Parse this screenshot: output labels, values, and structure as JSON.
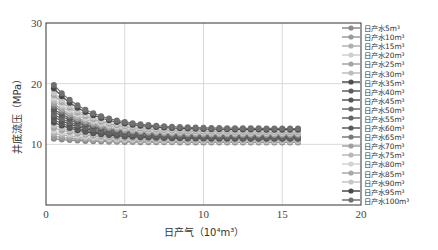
{
  "chart_data": {
    "type": "line",
    "title": "",
    "xlabel": "日产气（10⁴m³）",
    "ylabel": "井底流压（MPa）",
    "xlim": [
      0,
      20
    ],
    "ylim": [
      0,
      30
    ],
    "xticks": [
      "0",
      "5",
      "10",
      "15",
      "20"
    ],
    "yticks": [
      "10",
      "20",
      "30"
    ],
    "grid": true,
    "legend_position": "right",
    "markers": "circle",
    "x": [
      0.5,
      1,
      1.5,
      2,
      2.5,
      3,
      3.5,
      4,
      4.5,
      5,
      5.5,
      6,
      6.5,
      7,
      7.5,
      8,
      8.5,
      9,
      9.5,
      10,
      10.5,
      11,
      11.5,
      12,
      12.5,
      13,
      13.5,
      14,
      14.5,
      15,
      15.5,
      16
    ],
    "series": [
      {
        "name": "日产水5m³",
        "start": 10.9,
        "end": 10.3,
        "color": "#8a8a8a"
      },
      {
        "name": "日产水10m³",
        "start": 11.3,
        "end": 10.4,
        "color": "#9a9a9a"
      },
      {
        "name": "日产水15m³",
        "start": 11.8,
        "end": 10.5,
        "color": "#b0b0b0"
      },
      {
        "name": "日产水20m³",
        "start": 12.2,
        "end": 10.6,
        "color": "#cfcfcf"
      },
      {
        "name": "日产水25m³",
        "start": 12.7,
        "end": 10.7,
        "color": "#a5a5a5"
      },
      {
        "name": "日产水30m³",
        "start": 13.1,
        "end": 10.8,
        "color": "#bdbdbd"
      },
      {
        "name": "日产水35m³",
        "start": 13.6,
        "end": 10.9,
        "color": "#4e4e4e"
      },
      {
        "name": "日产水40m³",
        "start": 14.0,
        "end": 11.0,
        "color": "#5e5e5e"
      },
      {
        "name": "日产水45m³",
        "start": 14.5,
        "end": 11.1,
        "color": "#555555"
      },
      {
        "name": "日产水50m³",
        "start": 14.9,
        "end": 11.2,
        "color": "#6a6a6a"
      },
      {
        "name": "日产水55m³",
        "start": 15.4,
        "end": 11.3,
        "color": "#666666"
      },
      {
        "name": "日产水60m³",
        "start": 15.8,
        "end": 11.4,
        "color": "#5a5a5a"
      },
      {
        "name": "日产水65m³",
        "start": 16.3,
        "end": 11.5,
        "color": "#7a7a7a"
      },
      {
        "name": "日产水70m³",
        "start": 16.7,
        "end": 11.6,
        "color": "#a0a0a0"
      },
      {
        "name": "日产水75m³",
        "start": 17.2,
        "end": 11.8,
        "color": "#b8b8b8"
      },
      {
        "name": "日产水80m³",
        "start": 17.6,
        "end": 11.9,
        "color": "#d2d2d2"
      },
      {
        "name": "日产水85m³",
        "start": 18.1,
        "end": 12.0,
        "color": "#a8a8a8"
      },
      {
        "name": "日产水90m³",
        "start": 18.5,
        "end": 12.2,
        "color": "#c6c6c6"
      },
      {
        "name": "日产水95m³",
        "start": 19.2,
        "end": 12.4,
        "color": "#4a4a4a"
      },
      {
        "name": "日产水100m³",
        "start": 19.8,
        "end": 12.6,
        "color": "#707070"
      }
    ]
  }
}
